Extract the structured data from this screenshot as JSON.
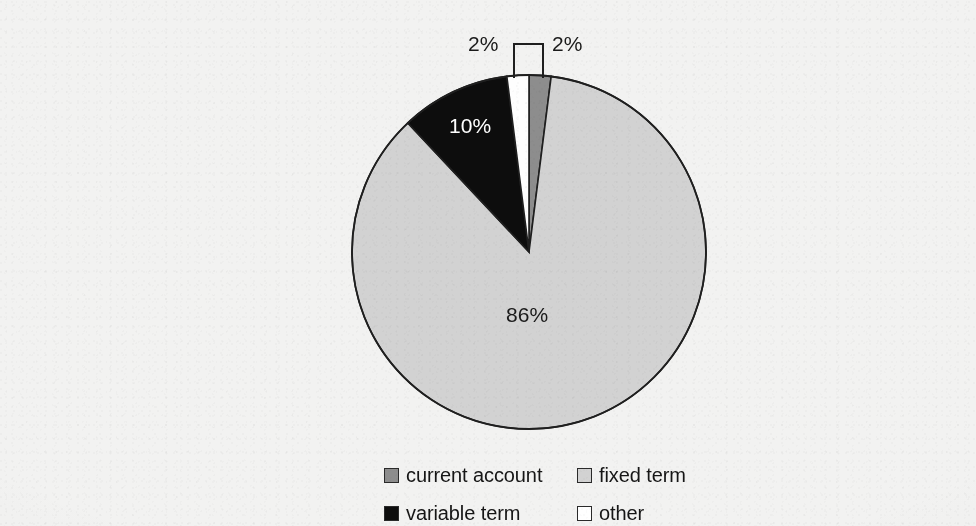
{
  "chart_data": {
    "type": "pie",
    "title": "",
    "subtitle": "",
    "xlabel": "",
    "ylabel": "",
    "grid": false,
    "legend_position": "bottom",
    "units": "percent",
    "start_angle_deg": 0,
    "direction": "clockwise",
    "categories": [
      "current account",
      "fixed term",
      "variable term",
      "other"
    ],
    "values": [
      2,
      86,
      10,
      2
    ],
    "value_labels": [
      "2%",
      "86%",
      "10%",
      "2%"
    ],
    "colors": [
      "#8d8d8d",
      "#d2d2d2",
      "#0d0d0d",
      "#fefefe"
    ],
    "slices": [
      {
        "label": "current account",
        "value": 2,
        "value_label": "2%",
        "color": "#8d8d8d",
        "start_deg": 0,
        "end_deg": 7.2,
        "label_placement": "callout-right",
        "label_text_color": "#1a1a1a"
      },
      {
        "label": "fixed term",
        "value": 86,
        "value_label": "86%",
        "color": "#d2d2d2",
        "start_deg": 7.2,
        "end_deg": 316.8,
        "label_placement": "inside",
        "label_text_color": "#1a1a1a"
      },
      {
        "label": "variable term",
        "value": 10,
        "value_label": "10%",
        "color": "#0d0d0d",
        "start_deg": 316.8,
        "end_deg": 352.8,
        "label_placement": "inside",
        "label_text_color": "#ffffff"
      },
      {
        "label": "other",
        "value": 2,
        "value_label": "2%",
        "color": "#fefefe",
        "start_deg": 352.8,
        "end_deg": 360,
        "label_placement": "callout-left",
        "label_text_color": "#1a1a1a"
      }
    ]
  },
  "figure": {
    "background_color": "#f2f2f1",
    "outline_color": "#1f1f1f",
    "center": {
      "x": 489,
      "y": 236
    },
    "radius": 177
  },
  "callouts": [
    {
      "name": "other-callout",
      "text": "2%",
      "text_x": 428,
      "text_y": 16
    },
    {
      "name": "current-account-callout",
      "text": "2%",
      "text_x": 512,
      "text_y": 16
    }
  ],
  "inside_labels": [
    {
      "name": "variable-term-value",
      "text": "10%",
      "x": 409,
      "y": 98
    },
    {
      "name": "fixed-term-value",
      "text": "86%",
      "x": 466,
      "y": 287
    }
  ],
  "legend": {
    "entries": [
      {
        "label": "current account",
        "color": "#8d8d8d",
        "swatch": "filled-square-icon"
      },
      {
        "label": "fixed term",
        "color": "#d2d2d2",
        "swatch": "filled-square-icon"
      },
      {
        "label": "variable term",
        "color": "#0d0d0d",
        "swatch": "filled-square-icon"
      },
      {
        "label": "other",
        "color": "#ffffff",
        "swatch": "outlined-square-icon"
      }
    ]
  }
}
